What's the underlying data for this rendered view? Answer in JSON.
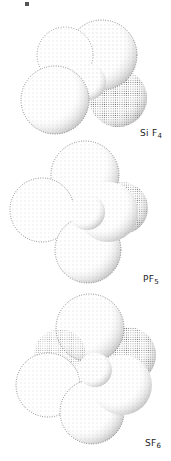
{
  "figures": [
    {
      "id": "sif4",
      "formula_main": "Si F",
      "formula_sub": "4",
      "label": "SiF4",
      "spheres": 4,
      "description": "stippled space-filling model of silicon tetrafluoride"
    },
    {
      "id": "pf5",
      "formula_main": "PF",
      "formula_sub": "5",
      "label": "PF5",
      "spheres": 5,
      "description": "stippled space-filling model of phosphorus pentafluoride"
    },
    {
      "id": "sf6",
      "formula_main": "SF",
      "formula_sub": "6",
      "label": "SF6",
      "spheres": 6,
      "description": "stippled space-filling model of sulfur hexafluoride"
    }
  ],
  "colors": {
    "ink": "#222222",
    "background": "#ffffff"
  }
}
